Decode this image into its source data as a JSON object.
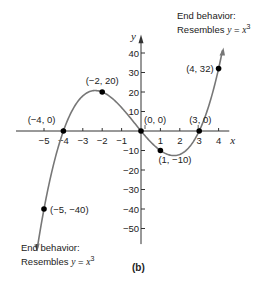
{
  "chart_data": {
    "type": "line",
    "title": "",
    "caption": "(b)",
    "xlabel": "x",
    "ylabel": "y",
    "xlim": [
      -5.5,
      4.6
    ],
    "ylim": [
      -58,
      48
    ],
    "x_ticks": [
      -5,
      -4,
      -3,
      -2,
      -1,
      1,
      2,
      3,
      4
    ],
    "y_ticks": [
      -50,
      -40,
      -30,
      -20,
      -10,
      10,
      20,
      30,
      40
    ],
    "grid": false,
    "function": "f(x) = x^3 + x^2 - 12x",
    "points": [
      {
        "x": -5,
        "y": -40,
        "label": "(−5, −40)"
      },
      {
        "x": -4,
        "y": 0,
        "label": "(−4, 0)"
      },
      {
        "x": -2,
        "y": 20,
        "label": "(−2, 20)"
      },
      {
        "x": 0,
        "y": 0,
        "label": "(0, 0)"
      },
      {
        "x": 1,
        "y": -10,
        "label": "(1, −10)"
      },
      {
        "x": 3,
        "y": 0,
        "label": "(3, 0)"
      },
      {
        "x": 4,
        "y": 32,
        "label": "(4, 32)"
      }
    ],
    "annotations": [
      {
        "text": "End behavior: Resembles y = x^3",
        "position": "top-right"
      },
      {
        "text": "End behavior: Resembles y = x^3",
        "position": "bottom-left"
      }
    ]
  },
  "labels": {
    "caption": "(b)",
    "x_axis": "x",
    "y_axis": "y",
    "end_top_line1": "End behavior:",
    "end_top_line2": "Resembles",
    "end_bottom_line1": "End behavior:",
    "end_bottom_line2": "Resembles",
    "eq_y": "y",
    "eq_eq": " = ",
    "eq_x": "x",
    "eq_exp": "3"
  }
}
